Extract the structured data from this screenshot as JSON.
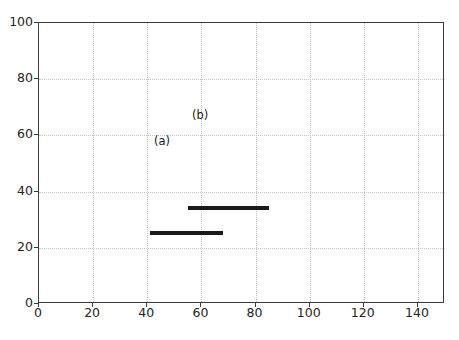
{
  "chart_data": {
    "type": "scatter",
    "title": "",
    "xlabel": "",
    "ylabel": "",
    "xlim": [
      0,
      150
    ],
    "ylim": [
      100,
      0
    ],
    "y_axis_inverted": true,
    "grid": true,
    "legend": "none",
    "xticks": [
      0,
      20,
      40,
      60,
      80,
      100,
      120,
      140
    ],
    "yticks": [
      0,
      20,
      40,
      60,
      80,
      100
    ],
    "xticklabels": [
      "0",
      "20",
      "40",
      "60",
      "80",
      "100",
      "120",
      "140"
    ],
    "yticklabels": [
      "0",
      "20",
      "40",
      "60",
      "80",
      "100"
    ],
    "boxes": [
      {
        "name": "(a)",
        "x": 41,
        "y": 26,
        "width": 27,
        "height": 35,
        "x2": 68,
        "y2": 61,
        "color": "#1a1a1a",
        "linewidth": 2,
        "fill": "none",
        "label": "(a)",
        "label_x": 42.5,
        "label_y": 57.5
      },
      {
        "name": "(b)",
        "x": 55,
        "y": 35,
        "width": 30,
        "height": 35,
        "x2": 85,
        "y2": 70,
        "color": "#1a1a1a",
        "linewidth": 2,
        "fill": "none",
        "label": "(b)",
        "label_x": 56.5,
        "label_y": 67
      }
    ],
    "colors": {
      "grid": "#c4c4c4",
      "axis": "#3b3b3b",
      "box": "#1a1a1a",
      "background": "#ffffff",
      "text": "#242424"
    }
  }
}
